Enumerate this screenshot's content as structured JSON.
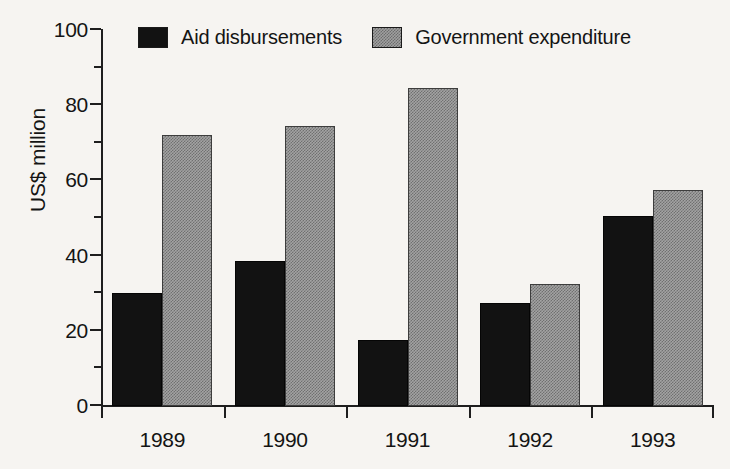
{
  "chart_data": {
    "type": "bar",
    "title": "",
    "xlabel": "",
    "ylabel": "US$ million",
    "categories": [
      "1989",
      "1990",
      "1991",
      "1992",
      "1993"
    ],
    "series": [
      {
        "name": "Aid disbursements",
        "color": "#121212",
        "values": [
          30,
          38.5,
          17.5,
          27.5,
          50.5
        ]
      },
      {
        "name": "Government expenditure",
        "color": "#a3a3a3",
        "values": [
          72,
          74.5,
          84.5,
          32.5,
          57.5
        ]
      }
    ],
    "ylim": [
      0,
      100
    ],
    "ytick_major": [
      0,
      20,
      40,
      60,
      80,
      100
    ],
    "ytick_minor": [
      10,
      30,
      50,
      70,
      90
    ],
    "ytick_labels": [
      "0",
      "20",
      "40",
      "60",
      "80",
      "100"
    ],
    "grid": false,
    "legend_position": "top-center"
  },
  "legend": {
    "entries": [
      {
        "label": "Aid disbursements",
        "swatch": "solid-black-swatch"
      },
      {
        "label": "Government expenditure",
        "swatch": "hatched-gray-swatch"
      }
    ]
  },
  "axes": {
    "y_title": "US$ million"
  },
  "colors": {
    "background": "#f6f4f1",
    "axis": "#1e1e1e",
    "text": "#141414",
    "series_aid": "#121212",
    "series_government": "#a3a3a3"
  }
}
